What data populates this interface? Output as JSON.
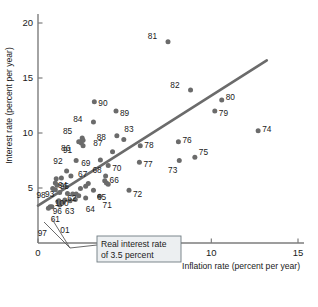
{
  "chart_data": {
    "type": "scatter",
    "title": "",
    "xlabel": "Inflation rate (percent per year)",
    "ylabel": "Interest rate (percent per year)",
    "xlim": [
      0,
      15
    ],
    "ylim": [
      0,
      20
    ],
    "xticks": [
      0,
      5,
      10,
      15
    ],
    "yticks": [
      5,
      10,
      15,
      20
    ],
    "xtick_labels": [
      "0",
      "5",
      "10",
      "15"
    ],
    "ytick_labels": [
      "5",
      "10",
      "15",
      "20"
    ],
    "grid": false,
    "legend": "none",
    "point_color": "#6b6b6b",
    "line_color": "#6b6b6b",
    "annotation": {
      "line1": "Real interest rate",
      "line2": "of 3.5 percent",
      "text": "Real interest rate of 3.5 percent"
    },
    "trend_line": {
      "label": "Real interest rate of 3.5 percent",
      "x": [
        0.0,
        13.2
      ],
      "y": [
        3.4,
        16.6
      ]
    },
    "points": [
      {
        "label": "81",
        "x": 7.5,
        "y": 18.3,
        "lx": -11,
        "ly": 0.5
      },
      {
        "label": "82",
        "x": 8.8,
        "y": 13.9,
        "lx": -11,
        "ly": 0.5
      },
      {
        "label": "80",
        "x": 10.6,
        "y": 13.0,
        "lx": 4,
        "ly": 0.3
      },
      {
        "label": "79",
        "x": 10.2,
        "y": 12.0,
        "lx": 4,
        "ly": -0.2
      },
      {
        "label": "90",
        "x": 3.25,
        "y": 12.85,
        "lx": 4,
        "ly": -0.1
      },
      {
        "label": "89",
        "x": 4.5,
        "y": 12.0,
        "lx": 4,
        "ly": -0.2
      },
      {
        "label": "84",
        "x": 3.2,
        "y": 11.0,
        "lx": -11,
        "ly": 0.3
      },
      {
        "label": "74",
        "x": 12.7,
        "y": 10.2,
        "lx": 4,
        "ly": 0.2
      },
      {
        "label": "83",
        "x": 4.95,
        "y": 9.4,
        "lx": 0.5,
        "ly": 1.0
      },
      {
        "label": "88",
        "x": 4.55,
        "y": 9.75,
        "lx": -11,
        "ly": -0.1
      },
      {
        "label": "85",
        "x": 2.55,
        "y": 9.55,
        "lx": -10,
        "ly": 0.6
      },
      {
        "label": "86",
        "x": 2.5,
        "y": 9.1,
        "lx": -11,
        "ly": -0.5
      },
      {
        "label": "85b",
        "x": 2.45,
        "y": 9.2,
        "lx": null,
        "ly": null
      },
      {
        "label": "76",
        "x": 8.1,
        "y": 9.2,
        "lx": 4,
        "ly": 0.2
      },
      {
        "label": "78",
        "x": 5.9,
        "y": 8.85,
        "lx": 4,
        "ly": 0.1
      },
      {
        "label": "87",
        "x": 4.3,
        "y": 8.3,
        "lx": -10,
        "ly": 0.8
      },
      {
        "label": "91",
        "x": 2.2,
        "y": 7.5,
        "lx": -4,
        "ly": 0.95
      },
      {
        "label": "75",
        "x": 9.05,
        "y": 7.8,
        "lx": 4,
        "ly": 0.5
      },
      {
        "label": "73",
        "x": 8.15,
        "y": 7.5,
        "lx": -2,
        "ly": -0.9
      },
      {
        "label": "77",
        "x": 5.85,
        "y": 7.35,
        "lx": 4,
        "ly": -0.2
      },
      {
        "label": "69",
        "x": 3.6,
        "y": 7.55,
        "lx": -10,
        "ly": -0.3
      },
      {
        "label": "70",
        "x": 4.05,
        "y": 7.05,
        "lx": 4,
        "ly": -0.25
      },
      {
        "label": "92",
        "x": 1.65,
        "y": 6.55,
        "lx": -4,
        "ly": 0.9
      },
      {
        "label": "95",
        "x": 1.9,
        "y": 6.1,
        "lx": -2,
        "ly": -0.9
      },
      {
        "label": "66",
        "x": 3.9,
        "y": 6.1,
        "lx": 4,
        "ly": -0.35
      },
      {
        "label": "68",
        "x": 3.85,
        "y": 5.65,
        "lx": -3,
        "ly": 0.95
      },
      {
        "label": "94",
        "x": 1.05,
        "y": 5.85,
        "lx": 2,
        "ly": -0.6
      },
      {
        "label": "93",
        "x": 1.0,
        "y": 5.45,
        "lx": -1,
        "ly": -0.95
      },
      {
        "label": "67",
        "x": 2.9,
        "y": 5.4,
        "lx": -1,
        "ly": 0.85
      },
      {
        "label": "62",
        "x": 2.45,
        "y": 4.95,
        "lx": -4,
        "ly": -0.85
      },
      {
        "label": "65",
        "x": 3.2,
        "y": 4.8,
        "lx": 3.5,
        "ly": -0.65
      },
      {
        "label": "98",
        "x": 0.85,
        "y": 4.95,
        "lx": -7,
        "ly": -0.55
      },
      {
        "label": "100",
        "x": 2.0,
        "y": 4.45,
        "lx": -4,
        "ly": -0.8
      },
      {
        "label": "71",
        "x": 3.55,
        "y": 4.25,
        "lx": 3,
        "ly": -0.8
      },
      {
        "label": "72",
        "x": 5.25,
        "y": 4.8,
        "lx": 4,
        "ly": -0.3
      },
      {
        "label": "64",
        "x": 2.75,
        "y": 4.1,
        "lx": 0,
        "ly": -1.0
      },
      {
        "label": "63",
        "x": 2.15,
        "y": 3.95,
        "lx": -1,
        "ly": -1.0
      },
      {
        "label": "96",
        "x": 1.55,
        "y": 3.9,
        "lx": -3,
        "ly": -1.0
      },
      {
        "label": "99",
        "x": 1.2,
        "y": 3.85,
        "lx": null,
        "ly": null
      },
      {
        "label": "61",
        "x": 0.7,
        "y": 3.3,
        "lx": 0.5,
        "ly": -1.1
      },
      {
        "label": "97",
        "x": 0.6,
        "y": 3.15,
        "lx": -1.5,
        "ly": -2.2
      },
      {
        "label": "01",
        "x": 1.25,
        "y": 3.45,
        "lx": 0.6,
        "ly": -2.3
      }
    ],
    "extra_points": [
      {
        "x": 2.6,
        "y": 9.35
      },
      {
        "x": 2.35,
        "y": 9.2
      },
      {
        "x": 2.6,
        "y": 8.85
      },
      {
        "x": 1.35,
        "y": 5.9
      },
      {
        "x": 1.1,
        "y": 5.25
      },
      {
        "x": 1.0,
        "y": 4.85
      },
      {
        "x": 1.25,
        "y": 4.6
      },
      {
        "x": 1.7,
        "y": 4.5
      },
      {
        "x": 2.2,
        "y": 4.45
      },
      {
        "x": 2.35,
        "y": 4.3
      },
      {
        "x": 1.15,
        "y": 3.75
      },
      {
        "x": 1.45,
        "y": 3.7
      },
      {
        "x": 1.85,
        "y": 3.85
      },
      {
        "x": 0.8,
        "y": 3.3
      },
      {
        "x": 3.95,
        "y": 5.45
      },
      {
        "x": 4.05,
        "y": 5.35
      },
      {
        "x": 2.75,
        "y": 5.15
      }
    ]
  }
}
